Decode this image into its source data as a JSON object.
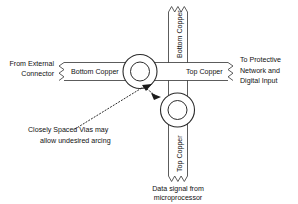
{
  "figure": {
    "background_color": "#ffffff",
    "line_color": "#4a4a4a",
    "text_color": "#111111"
  },
  "labels": {
    "left_source_line1": "From External",
    "left_source_line2": "Connector",
    "right_dest_line1": "To Protective",
    "right_dest_line2": "Network and",
    "right_dest_line3": "Digital Input",
    "horizontal_left_trace": "Bottom Copper",
    "horizontal_right_trace": "Top Copper",
    "vertical_top_trace": "Bottom Copper",
    "vertical_bottom_trace": "Top Copper",
    "bottom_source_line1": "Data signal from",
    "bottom_source_line2": "microprocessor",
    "annotation_line1": "Closely Spaced Vias may",
    "annotation_line2": "allow undesired arcing"
  },
  "icons": {
    "break_symbol": "zigzag-break-icon",
    "via_upper": "via-pad-icon",
    "via_lower": "via-pad-icon",
    "arc_indicator": "dotted-arc-arrow-icon"
  }
}
